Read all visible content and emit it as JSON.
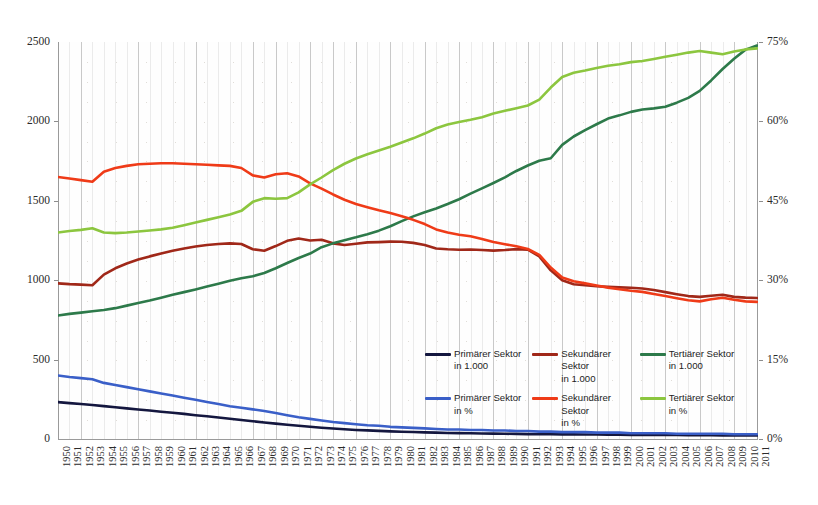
{
  "chart_data": {
    "type": "line",
    "title": "",
    "subtitle": "",
    "xlabel": "",
    "ylabel": "",
    "ylabel_right": "",
    "grid": true,
    "legend_position": "inside-lower-center",
    "x": [
      1950,
      1951,
      1952,
      1953,
      1954,
      1955,
      1956,
      1957,
      1958,
      1959,
      1960,
      1961,
      1962,
      1963,
      1964,
      1965,
      1966,
      1967,
      1968,
      1969,
      1970,
      1971,
      1972,
      1973,
      1974,
      1975,
      1976,
      1977,
      1978,
      1979,
      1980,
      1981,
      1982,
      1983,
      1984,
      1985,
      1986,
      1987,
      1988,
      1989,
      1990,
      1991,
      1992,
      1993,
      1994,
      1995,
      1996,
      1997,
      1998,
      1999,
      2000,
      2001,
      2002,
      2003,
      2004,
      2005,
      2006,
      2007,
      2008,
      2009,
      2010,
      2011
    ],
    "xtick_labels": [
      "1950",
      "1951",
      "1952",
      "1953",
      "1954",
      "1955",
      "1956",
      "1957",
      "1958",
      "1959",
      "1960",
      "1961",
      "1962",
      "1963",
      "1964",
      "1965",
      "1966",
      "1967",
      "1968",
      "1969",
      "1970",
      "1971",
      "1972",
      "1973",
      "1974",
      "1975",
      "1976",
      "1977",
      "1978",
      "1979",
      "1980",
      "1981",
      "1982",
      "1983",
      "1984",
      "1985",
      "1986",
      "1987",
      "1988",
      "1989",
      "1990",
      "1991",
      "1992",
      "1993",
      "1994",
      "1995",
      "1996",
      "1997",
      "1998",
      "1999",
      "2000",
      "2001",
      "2002",
      "2003",
      "2004",
      "2005",
      "2006",
      "2007",
      "2008",
      "2009",
      "2010",
      "2011"
    ],
    "ylim": [
      0,
      2500
    ],
    "ytick_labels": [
      "0",
      "500",
      "1000",
      "1500",
      "2000",
      "2500"
    ],
    "ytick_values": [
      0,
      500,
      1000,
      1500,
      2000,
      2500
    ],
    "ylim_right": [
      0,
      75
    ],
    "ytick_labels_right": [
      "0%",
      "15%",
      "30%",
      "45%",
      "60%",
      "75%"
    ],
    "ytick_values_right": [
      0,
      15,
      30,
      45,
      60,
      75
    ],
    "series": [
      {
        "name": "Primärer Sektor in 1.000",
        "legend_line1": "Primärer Sektor",
        "legend_line2": "in 1.000",
        "axis": "left",
        "unit": "in 1.000",
        "color": "#14173f",
        "values": [
          232,
          226,
          220,
          214,
          207,
          200,
          193,
          186,
          179,
          172,
          165,
          158,
          150,
          143,
          135,
          128,
          120,
          112,
          104,
          97,
          90,
          83,
          77,
          71,
          66,
          61,
          57,
          54,
          51,
          48,
          46,
          44,
          42,
          40,
          38,
          37,
          36,
          35,
          34,
          33,
          32,
          31,
          30,
          30,
          29,
          29,
          28,
          28,
          27,
          27,
          26,
          26,
          25,
          25,
          25,
          24,
          24,
          24,
          23,
          23,
          23,
          22
        ]
      },
      {
        "name": "Sekundärer Sektor in 1.000",
        "legend_line1": "Sekundärer Sektor",
        "legend_line2": "in 1.000",
        "axis": "left",
        "unit": "in 1.000",
        "color": "#a02819",
        "values": [
          980,
          975,
          972,
          968,
          1035,
          1075,
          1105,
          1130,
          1150,
          1168,
          1185,
          1200,
          1212,
          1222,
          1228,
          1232,
          1228,
          1195,
          1185,
          1215,
          1248,
          1262,
          1250,
          1255,
          1232,
          1222,
          1230,
          1238,
          1240,
          1243,
          1242,
          1235,
          1222,
          1200,
          1195,
          1192,
          1193,
          1190,
          1186,
          1190,
          1196,
          1192,
          1150,
          1062,
          1000,
          975,
          968,
          962,
          958,
          955,
          952,
          948,
          938,
          925,
          912,
          900,
          895,
          902,
          908,
          895,
          890,
          888
        ]
      },
      {
        "name": "Tertiärer Sektor in 1.000",
        "legend_line1": "Tertiärer Sektor",
        "legend_line2": "in 1.000",
        "axis": "left",
        "unit": "in 1.000",
        "color": "#2d7a4a",
        "values": [
          778,
          788,
          796,
          805,
          812,
          824,
          840,
          856,
          872,
          890,
          908,
          925,
          942,
          960,
          978,
          996,
          1012,
          1025,
          1045,
          1075,
          1108,
          1140,
          1168,
          1208,
          1232,
          1252,
          1270,
          1290,
          1312,
          1340,
          1372,
          1402,
          1428,
          1452,
          1480,
          1510,
          1545,
          1578,
          1612,
          1648,
          1688,
          1722,
          1752,
          1768,
          1852,
          1905,
          1945,
          1982,
          2018,
          2038,
          2060,
          2075,
          2082,
          2092,
          2118,
          2148,
          2192,
          2258,
          2330,
          2395,
          2452,
          2478
        ]
      },
      {
        "name": "Primärer Sektor in %",
        "legend_line1": "Primärer Sektor",
        "legend_line2": "in %",
        "axis": "right",
        "unit": "%",
        "color": "#3a5fc8",
        "values": [
          12.0,
          11.7,
          11.5,
          11.3,
          10.6,
          10.2,
          9.8,
          9.4,
          9.0,
          8.6,
          8.2,
          7.8,
          7.4,
          7.0,
          6.6,
          6.2,
          5.9,
          5.6,
          5.3,
          4.9,
          4.5,
          4.1,
          3.8,
          3.5,
          3.2,
          3.0,
          2.8,
          2.6,
          2.5,
          2.3,
          2.2,
          2.1,
          2.0,
          1.9,
          1.8,
          1.8,
          1.7,
          1.7,
          1.6,
          1.6,
          1.5,
          1.5,
          1.4,
          1.4,
          1.3,
          1.3,
          1.3,
          1.2,
          1.2,
          1.2,
          1.1,
          1.1,
          1.1,
          1.1,
          1.0,
          1.0,
          1.0,
          1.0,
          1.0,
          0.9,
          0.9,
          0.9
        ]
      },
      {
        "name": "Sekundärer Sektor in %",
        "legend_line1": "Sekundärer Sektor",
        "legend_line2": "in %",
        "axis": "right",
        "unit": "%",
        "color": "#ef3b18",
        "values": [
          49.5,
          49.2,
          48.9,
          48.6,
          50.5,
          51.2,
          51.6,
          51.9,
          52.0,
          52.1,
          52.1,
          52.0,
          51.9,
          51.8,
          51.7,
          51.6,
          51.2,
          49.8,
          49.4,
          50.0,
          50.2,
          49.6,
          48.3,
          47.3,
          46.2,
          45.2,
          44.4,
          43.8,
          43.2,
          42.7,
          42.1,
          41.4,
          40.6,
          39.6,
          39.0,
          38.6,
          38.3,
          37.8,
          37.2,
          36.8,
          36.4,
          35.9,
          34.8,
          32.4,
          30.5,
          29.8,
          29.4,
          29.0,
          28.6,
          28.3,
          28.0,
          27.8,
          27.4,
          27.0,
          26.6,
          26.2,
          26.0,
          26.4,
          26.7,
          26.3,
          26.0,
          25.9
        ]
      },
      {
        "name": "Tertiärer Sektor in %",
        "legend_line1": "Tertiärer Sektor",
        "legend_line2": "in %",
        "axis": "right",
        "unit": "%",
        "color": "#8cc63f",
        "values": [
          39.0,
          39.3,
          39.5,
          39.8,
          39.0,
          38.9,
          39.0,
          39.2,
          39.4,
          39.6,
          39.9,
          40.4,
          40.9,
          41.4,
          41.9,
          42.4,
          43.1,
          44.8,
          45.5,
          45.4,
          45.5,
          46.6,
          48.1,
          49.4,
          50.8,
          52.0,
          53.0,
          53.8,
          54.5,
          55.2,
          56.0,
          56.8,
          57.7,
          58.7,
          59.4,
          59.9,
          60.3,
          60.8,
          61.5,
          62.0,
          62.5,
          63.0,
          64.1,
          66.4,
          68.4,
          69.2,
          69.6,
          70.1,
          70.5,
          70.8,
          71.2,
          71.4,
          71.8,
          72.2,
          72.6,
          73.0,
          73.3,
          73.0,
          72.7,
          73.2,
          73.6,
          73.8
        ]
      }
    ]
  },
  "legend": {
    "items": [
      {
        "label_line1": "Primärer Sektor",
        "label_line2": "in 1.000",
        "color": "#14173f"
      },
      {
        "label_line1": "Sekundärer Sektor",
        "label_line2": "in 1.000",
        "color": "#a02819"
      },
      {
        "label_line1": "Tertiärer Sektor",
        "label_line2": "in 1.000",
        "color": "#2d7a4a"
      },
      {
        "label_line1": "Primärer Sektor",
        "label_line2": "in %",
        "color": "#3a5fc8"
      },
      {
        "label_line1": "Sekundärer Sektor",
        "label_line2": "in %",
        "color": "#ef3b18"
      },
      {
        "label_line1": "Tertiärer Sektor",
        "label_line2": "in %",
        "color": "#8cc63f"
      }
    ]
  }
}
